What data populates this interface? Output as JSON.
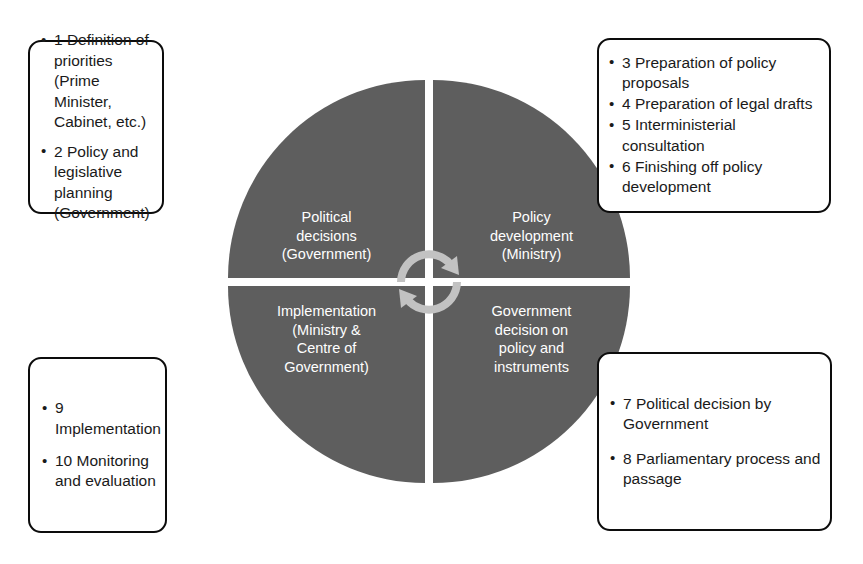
{
  "diagram": {
    "colors": {
      "circle_fill": "#5e5e5e",
      "quadrant_text": "#ffffff",
      "divider": "#ffffff",
      "box_border": "#0c0c0c",
      "box_fill": "#ffffff",
      "box_text": "#1a1a1a",
      "center_arrow": "#bfbfbf"
    },
    "center": {
      "icon": "cycle-rotation-arrow",
      "description": "two-headed circular rotation arrow"
    },
    "quadrants": [
      {
        "id": "political-decisions",
        "position": "top-left",
        "label": "Political\ndecisions\n(Government)"
      },
      {
        "id": "policy-development",
        "position": "top-right",
        "label": "Policy\ndevelopment\n(Ministry)"
      },
      {
        "id": "implementation",
        "position": "bottom-left",
        "label": "Implementation\n(Ministry &\nCentre of\nGovernment)"
      },
      {
        "id": "government-decision",
        "position": "bottom-right",
        "label": "Government\ndecision on\npolicy and\ninstruments"
      }
    ],
    "callouts": [
      {
        "id": "callout-top-left",
        "position": "top-left",
        "linked_quadrant": "political-decisions",
        "bullet_glyph": "•",
        "items": [
          "1 Definition of priorities (Prime Minister, Cabinet, etc.)",
          "2 Policy and legislative planning (Government)"
        ]
      },
      {
        "id": "callout-top-right",
        "position": "top-right",
        "linked_quadrant": "policy-development",
        "bullet_glyph": "•",
        "items": [
          "3 Preparation of policy proposals",
          "4 Preparation of legal drafts",
          "5 Interministerial consultation",
          "6 Finishing off policy development"
        ]
      },
      {
        "id": "callout-bottom-left",
        "position": "bottom-left",
        "linked_quadrant": "implementation",
        "bullet_glyph": "•",
        "items": [
          "9 Implementation",
          "10 Monitoring and evaluation"
        ]
      },
      {
        "id": "callout-bottom-right",
        "position": "bottom-right",
        "linked_quadrant": "government-decision",
        "bullet_glyph": "•",
        "items": [
          "7 Political decision by Government",
          "8 Parliamentary process and passage"
        ]
      }
    ]
  }
}
